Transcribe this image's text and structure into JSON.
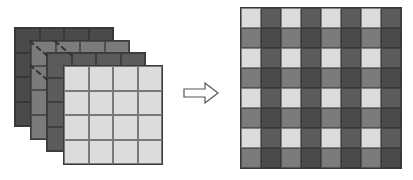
{
  "diagram": {
    "colors": {
      "layer1": "#4a4a4a",
      "layer2": "#7b7b7b",
      "layer3": "#5b5b5b",
      "layer4": "#dcdcdc",
      "grid_line": "#333333",
      "arrow_stroke": "#555555"
    },
    "input": {
      "layers": 4,
      "grid_size": 4,
      "layer_order_back_to_front": [
        "layer1",
        "layer2",
        "layer3",
        "layer4"
      ]
    },
    "arrow": {
      "icon": "hollow-right-arrow-icon"
    },
    "output": {
      "grid_size": 8,
      "block_pattern": [
        [
          "layer4",
          "layer3"
        ],
        [
          "layer2",
          "layer1"
        ]
      ]
    }
  }
}
